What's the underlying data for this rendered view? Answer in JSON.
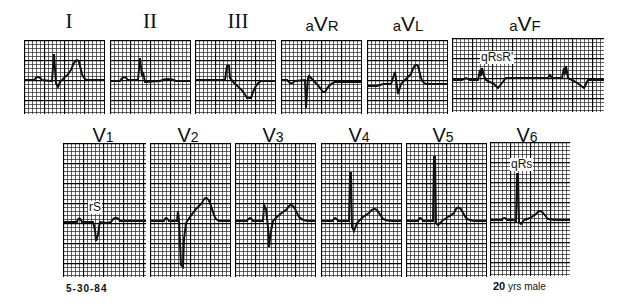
{
  "figure": {
    "date": "5-30-84",
    "patient": {
      "age_num": "20",
      "age_rest": "yrs male"
    },
    "grid_color": "#000000",
    "trace_color": "#111111"
  },
  "leads": [
    {
      "id": "I",
      "label": "I",
      "style": "roman"
    },
    {
      "id": "II",
      "label": "II",
      "style": "roman"
    },
    {
      "id": "III",
      "label": "III",
      "style": "roman"
    },
    {
      "id": "aVR",
      "prefix": "a",
      "main": "V",
      "suffix": "R",
      "style": "aug"
    },
    {
      "id": "aVL",
      "prefix": "a",
      "main": "V",
      "suffix": "L",
      "style": "aug"
    },
    {
      "id": "aVF",
      "prefix": "a",
      "main": "V",
      "suffix": "F",
      "style": "aug",
      "annotation": "qRsR'"
    },
    {
      "id": "V1",
      "main": "V",
      "sub": "1",
      "style": "prec",
      "annotation": "rS"
    },
    {
      "id": "V2",
      "main": "V",
      "sub": "2",
      "style": "prec"
    },
    {
      "id": "V3",
      "main": "V",
      "sub": "3",
      "style": "prec"
    },
    {
      "id": "V4",
      "main": "V",
      "sub": "4",
      "style": "prec"
    },
    {
      "id": "V5",
      "main": "V",
      "sub": "5",
      "style": "prec"
    },
    {
      "id": "V6",
      "main": "V",
      "sub": "6",
      "style": "prec",
      "annotation": "qRs"
    }
  ]
}
